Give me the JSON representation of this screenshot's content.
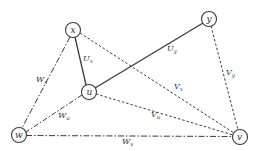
{
  "diagram": {
    "type": "graph",
    "colors": {
      "stroke": "#3a3a3a",
      "background": "#ffffff"
    },
    "nodes": [
      {
        "id": "x",
        "label": "x",
        "cx": 73,
        "cy": 30
      },
      {
        "id": "y",
        "label": "y",
        "cx": 209,
        "cy": 19
      },
      {
        "id": "u",
        "label": "u",
        "cx": 89,
        "cy": 92
      },
      {
        "id": "w",
        "label": "w",
        "cx": 19,
        "cy": 135
      },
      {
        "id": "v",
        "label": "v",
        "cx": 240,
        "cy": 137
      }
    ],
    "edges": [
      {
        "from": "x",
        "to": "u",
        "style": "solid",
        "label": "U",
        "sub": "x"
      },
      {
        "from": "y",
        "to": "u",
        "style": "solid",
        "label": "U",
        "sub": "y"
      },
      {
        "from": "y",
        "to": "v",
        "style": "dashed",
        "label": "V",
        "sub": "y"
      },
      {
        "from": "x",
        "to": "v",
        "style": "dashed",
        "label": "V",
        "sub": "x"
      },
      {
        "from": "u",
        "to": "v",
        "style": "dashed",
        "label": "V",
        "sub": "u"
      },
      {
        "from": "x",
        "to": "w",
        "style": "dash-dot",
        "label": "W",
        "sub": "x"
      },
      {
        "from": "u",
        "to": "w",
        "style": "dash-dot",
        "label": "W",
        "sub": "u"
      },
      {
        "from": "w",
        "to": "v",
        "style": "dash-dot",
        "label": "W",
        "sub": "v"
      }
    ]
  }
}
